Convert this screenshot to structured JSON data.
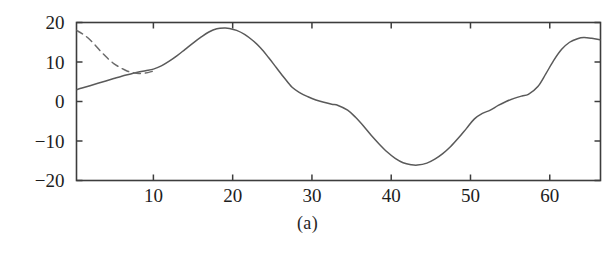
{
  "figure": {
    "caption": "(a)",
    "axes": {
      "xlim": [
        0.3,
        66.4
      ],
      "ylim": [
        -20,
        20
      ],
      "x_ticks": [
        10,
        20,
        30,
        40,
        50,
        60
      ],
      "x_tick_labels": [
        "10",
        "20",
        "30",
        "40",
        "50",
        "60"
      ],
      "y_ticks": [
        -20,
        -10,
        0,
        10,
        20
      ],
      "y_tick_labels": [
        "-20",
        "-10",
        "0",
        "10",
        "20"
      ],
      "frame": "box-all-sides",
      "tick_direction": "in",
      "grid": false,
      "xlabel": "",
      "ylabel": ""
    },
    "colors": {
      "line": "#5a5a5a",
      "dashed_line": "#6b6b6b",
      "frame": "#3d3d3d",
      "text": "#1d1d1d",
      "background": "#ffffff"
    }
  },
  "chart_data": {
    "type": "line",
    "title": "",
    "subtitle": "",
    "xlabel": "",
    "ylabel": "",
    "xlim": [
      0.3,
      66.4
    ],
    "ylim": [
      -20,
      20
    ],
    "grid": false,
    "legend": "none",
    "annotations": [
      "(a)"
    ],
    "series": [
      {
        "name": "solid-curve",
        "style": "solid",
        "color": "#5a5a5a",
        "x": [
          0.3,
          1,
          2,
          3,
          4,
          5,
          6,
          7,
          8,
          9,
          10,
          11,
          12,
          13,
          14,
          15,
          16,
          17,
          18,
          19,
          19.6,
          20.5,
          21.5,
          22.5,
          23.5,
          24.5,
          25.5,
          26.5,
          27.5,
          28.5,
          29.5,
          30.5,
          31.5,
          32.5,
          33.3,
          34.5,
          35.5,
          36.5,
          37.5,
          38.5,
          39.5,
          40.5,
          41.5,
          42.5,
          43.3,
          44.5,
          45.5,
          46.5,
          47.5,
          48.5,
          49.5,
          50.5,
          51.5,
          52.5,
          53.5,
          54.5,
          55.5,
          56.5,
          57.3,
          58.5,
          59.5,
          60.5,
          61.5,
          62.5,
          63.5,
          64.3,
          65.3,
          66.4
        ],
        "y": [
          3.0,
          3.4,
          4.0,
          4.6,
          5.2,
          5.8,
          6.4,
          6.9,
          7.4,
          7.8,
          8.2,
          9.0,
          10.2,
          11.6,
          13.2,
          14.8,
          16.3,
          17.6,
          18.4,
          18.6,
          18.5,
          18.0,
          17.0,
          15.5,
          13.6,
          11.2,
          8.6,
          6.0,
          3.6,
          2.2,
          1.2,
          0.4,
          -0.2,
          -0.7,
          -1.0,
          -2.2,
          -4.0,
          -6.2,
          -8.6,
          -10.8,
          -12.8,
          -14.4,
          -15.5,
          -16.0,
          -16.1,
          -15.6,
          -14.6,
          -13.2,
          -11.4,
          -9.2,
          -6.8,
          -4.4,
          -3.0,
          -2.2,
          -1.0,
          0.0,
          0.8,
          1.4,
          1.8,
          3.8,
          7.0,
          10.4,
          13.2,
          15.0,
          15.9,
          16.2,
          16.0,
          15.6
        ]
      },
      {
        "name": "dashed-curve",
        "style": "dashed",
        "color": "#6b6b6b",
        "x": [
          0.3,
          1,
          1.8,
          2.6,
          3.4,
          4.2,
          5.0,
          5.8,
          6.6,
          7.4,
          8.2,
          9.0,
          9.8,
          10.4
        ],
        "y": [
          18.0,
          17.2,
          16.0,
          14.4,
          12.6,
          11.0,
          9.6,
          8.6,
          7.8,
          7.3,
          7.1,
          7.2,
          7.6,
          8.0
        ]
      }
    ]
  }
}
